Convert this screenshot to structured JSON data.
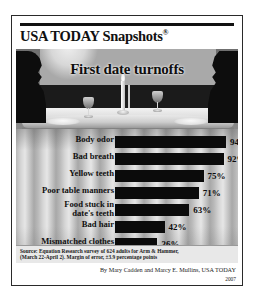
{
  "header": {
    "title": "USA TODAY Snapshots",
    "registered_mark": "®"
  },
  "illustration": {
    "headline": "First date turnoffs",
    "scene_elements": [
      "silhouette-left",
      "silhouette-right",
      "curtain-valance",
      "dinner-table",
      "plate-left",
      "plate-right",
      "wine-glass-1",
      "wine-glass-2",
      "candle"
    ]
  },
  "chart_data": {
    "type": "bar",
    "orientation": "horizontal",
    "title": "First date turnoffs",
    "xlabel": "",
    "ylabel": "",
    "xlim": [
      0,
      100
    ],
    "grid": false,
    "legend": null,
    "categories": [
      "Body odor",
      "Bad breath",
      "Yellow teeth",
      "Poor table manners",
      "Food stuck in\ndate's teeth",
      "Bad hair",
      "Mismatched clothes"
    ],
    "values": [
      94,
      92,
      75,
      71,
      63,
      42,
      36
    ],
    "value_labels": [
      "94%",
      "92%",
      "75%",
      "71%",
      "63%",
      "42%",
      "36%"
    ],
    "bar_color": "#0b0b0b"
  },
  "source": {
    "line1": "Source: Equation Research survey of 624 adults for Arm & Hammer,",
    "line2": "(March 22-April 2). Margin of error, ±3.9 percentage points"
  },
  "byline": {
    "credit": "By Mary Cadden and Marcy E. Mullins, USA TODAY",
    "year": "2007"
  }
}
